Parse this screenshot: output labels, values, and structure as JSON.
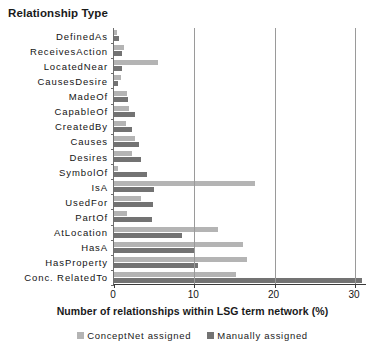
{
  "chart_data": {
    "type": "bar",
    "orientation": "horizontal",
    "title": "Relationship Type",
    "xlabel": "Number of relationships within LSG term network (%)",
    "ylabel": "Relationship Type",
    "xlim": [
      0,
      31.5
    ],
    "xticks": [
      0,
      10,
      20,
      30
    ],
    "xticklabels": [
      "0",
      "10",
      "20",
      "30"
    ],
    "grid": "vertical",
    "legend_position": "bottom",
    "categories": [
      "DefinedAs",
      "ReceivesAction",
      "LocatedNear",
      "CausesDesire",
      "MadeOf",
      "CapableOf",
      "CreatedBy",
      "Causes",
      "Desires",
      "SymbolOf",
      "IsA",
      "UsedFor",
      "PartOf",
      "AtLocation",
      "HasA",
      "HasProperty",
      "Conc. RelatedTo"
    ],
    "series": [
      {
        "name": "ConceptNet assigned",
        "color": "#b4b4b4",
        "values": [
          0.4,
          1.3,
          5.5,
          0.9,
          1.6,
          1.9,
          1.5,
          2.6,
          2.3,
          0.5,
          17.5,
          3.3,
          1.6,
          13.0,
          16.0,
          16.6,
          15.2
        ]
      },
      {
        "name": "Manually assigned",
        "color": "#737373",
        "values": [
          0.6,
          1.0,
          1.0,
          0.5,
          1.8,
          2.6,
          2.2,
          3.1,
          3.4,
          4.1,
          5.0,
          4.9,
          4.7,
          8.5,
          10.0,
          10.5,
          30.9
        ]
      }
    ]
  },
  "legend": {
    "entries": [
      {
        "label": "ConceptNet assigned",
        "color": "#b4b4b4"
      },
      {
        "label": "Manually assigned",
        "color": "#737373"
      }
    ]
  },
  "colors": {
    "conceptnet": "#b4b4b4",
    "manual": "#737373",
    "axis": "#3a3a3a",
    "grid": "#9a9a9a",
    "text": "#141414",
    "background": "#ffffff"
  }
}
